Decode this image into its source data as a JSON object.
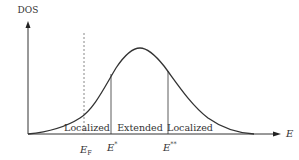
{
  "diagram": {
    "type": "density-of-states",
    "y_axis": {
      "label": "DOS"
    },
    "x_axis": {
      "label": "E"
    },
    "regions": [
      {
        "label": "Localized"
      },
      {
        "label": "Extended"
      },
      {
        "label": "Localized"
      }
    ],
    "energy_markers": [
      {
        "symbol": "E",
        "subscript": "F",
        "style": "dotted"
      },
      {
        "symbol": "E",
        "superscript": "*",
        "style": "solid"
      },
      {
        "symbol": "E",
        "superscript": "**",
        "style": "solid"
      }
    ],
    "colors": {
      "curve": "#333333",
      "axes": "#333333",
      "dotted_line": "#888888",
      "background": "#ffffff"
    }
  }
}
